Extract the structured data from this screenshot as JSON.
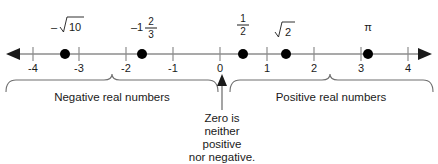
{
  "figure": {
    "background_color": "#ffffff",
    "axis_color": "#8d8d8d",
    "dot_color": "#000000",
    "text_color": "#1a1a1a"
  },
  "number_line": {
    "min": -4,
    "max": 4,
    "left_arrow": "left-arrowhead",
    "right_arrow": "right-arrowhead",
    "tick_labels": [
      "-4",
      "-3",
      "-2",
      "-1",
      "0",
      "1",
      "2",
      "3",
      "4"
    ],
    "tick_values": [
      -4,
      -3,
      -2,
      -1,
      0,
      1,
      2,
      3,
      4
    ]
  },
  "points": [
    {
      "id": "neg-sqrt-10",
      "value": -3.162,
      "label_kind": "radical",
      "sign": "–",
      "radicand": "10"
    },
    {
      "id": "neg-one-and-two-thirds",
      "value": -1.667,
      "label_kind": "mixed",
      "whole": "–1",
      "numerator": "2",
      "denominator": "3"
    },
    {
      "id": "one-half",
      "value": 0.5,
      "label_kind": "fraction",
      "numerator": "1",
      "denominator": "2"
    },
    {
      "id": "sqrt-2",
      "value": 1.414,
      "label_kind": "radical",
      "sign": "",
      "radicand": "2"
    },
    {
      "id": "pi",
      "value": 3.1416,
      "label_kind": "symbol",
      "text": "π"
    }
  ],
  "annotations": {
    "negative_caption": "Negative real numbers",
    "positive_caption": "Positive real numbers",
    "zero_note_lines": [
      "Zero is",
      "neither",
      "positive",
      "nor negative."
    ]
  }
}
